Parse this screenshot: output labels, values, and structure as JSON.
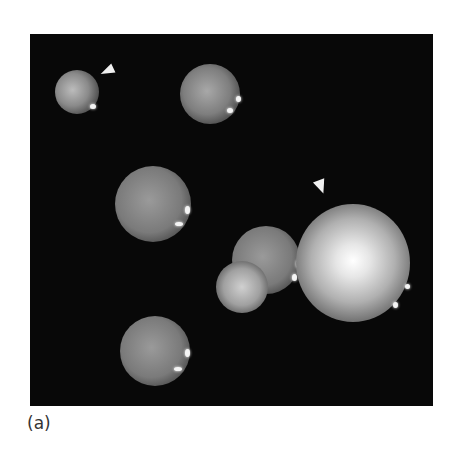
{
  "figure": {
    "panel_label": "(a)",
    "colors": {
      "background": "#080808",
      "page": "#ffffff"
    },
    "arrowheads": 2,
    "spheres": 8
  }
}
